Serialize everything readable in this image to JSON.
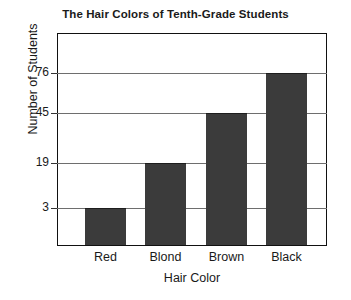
{
  "chart_data": {
    "type": "bar",
    "title": "The Hair Colors of Tenth-Grade Students",
    "xlabel": "Hair Color",
    "ylabel": "Number of Students",
    "categories": [
      "Red",
      "Blond",
      "Brown",
      "Black"
    ],
    "values": [
      3,
      19,
      45,
      76
    ],
    "series": [
      {
        "name": "Number of Students",
        "values": [
          3,
          19,
          45,
          76
        ]
      }
    ],
    "ytick_labels": [
      "3",
      "19",
      "45",
      "76"
    ],
    "ytick_values": [
      3,
      19,
      45,
      76
    ],
    "ylim": [
      0,
      92
    ],
    "grid": true,
    "gridlines_horizontal": true,
    "legend": false,
    "legend_position": "none",
    "bar_color": "#3b3b3b",
    "frame_color": "#111111",
    "gridline_color": "#6e6e6e",
    "background_color": "#ffffff",
    "text_color": "#1a1a1a",
    "annotations": []
  },
  "geometry": {
    "plot": {
      "left": 57,
      "top": 33,
      "width": 270,
      "height": 213
    },
    "baseline_y": 244,
    "ticks": [
      {
        "label": "3",
        "y": 208
      },
      {
        "label": "19",
        "y": 163
      },
      {
        "label": "45",
        "y": 113
      },
      {
        "label": "76",
        "y": 73
      }
    ],
    "bars": [
      {
        "label": "Red",
        "x": 85,
        "width": 41,
        "top": 208
      },
      {
        "label": "Blond",
        "x": 145,
        "width": 41,
        "top": 163
      },
      {
        "label": "Brown",
        "x": 206,
        "width": 41,
        "top": 113
      },
      {
        "label": "Black",
        "x": 266,
        "width": 41,
        "top": 73
      }
    ],
    "x_label_centers": [
      105.5,
      165.5,
      226.5,
      286.5
    ]
  }
}
